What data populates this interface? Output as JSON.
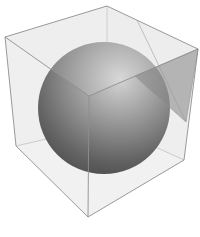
{
  "diagram": {
    "background": "#ffffff",
    "cube": {
      "edge_color": "#9a9a9a",
      "face_fill": "#e6e6e6",
      "vertices": {
        "top": [
          107,
          6
        ],
        "left_top": [
          5,
          37
        ],
        "right_top": [
          198,
          49
        ],
        "front_top": [
          89,
          96
        ],
        "left_bottom": [
          16,
          146
        ],
        "right_bottom": [
          184,
          160
        ],
        "bottom": [
          88,
          217
        ],
        "back_bottom": [
          107,
          125
        ]
      }
    },
    "sphere": {
      "cx": 104,
      "cy": 108,
      "r": 66,
      "highlight_color": "#c8c8c8",
      "shadow_color": "#1a1a1a"
    },
    "cutting_plane": {
      "fill": "#6a6a6a",
      "opacity": 0.55,
      "points": [
        [
          135,
          76
        ],
        [
          198,
          49
        ],
        [
          186,
          122
        ]
      ],
      "diagonal_from": [
        137,
        20
      ],
      "diagonal_to": [
        186,
        122
      ]
    }
  }
}
